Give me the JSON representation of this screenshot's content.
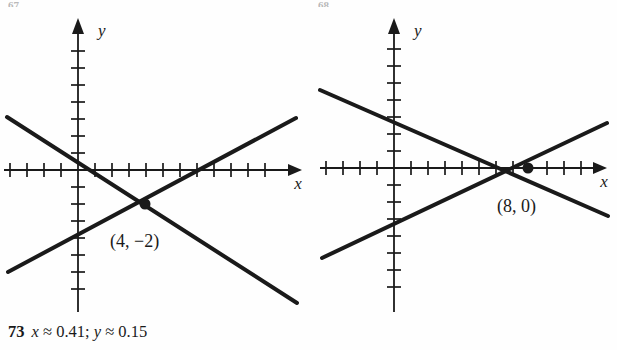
{
  "page": {
    "background_color": "#fefefe",
    "ink_color": "#1a1a1a",
    "clip_mark_left": "67.",
    "clip_mark_right": "68."
  },
  "answer": {
    "number": "73",
    "text": "x ≈ 0.41; y ≈ 0.15",
    "x_symbol": "x",
    "x_value": "≈ 0.41;",
    "y_symbol": "y",
    "y_value": "≈ 0.15"
  },
  "figures": [
    {
      "id": "figure-left",
      "name": "graph-left",
      "axis": {
        "x_label": "x",
        "y_label": "y",
        "origin_px": [
          78,
          170
        ],
        "tick_spacing_px": 17,
        "x_ticks_left": 4,
        "x_ticks_right": 13,
        "y_ticks_up": 7,
        "y_ticks_down": 8
      },
      "point": {
        "label": "(4, −2)",
        "x": 4,
        "y": -2,
        "px": [
          145,
          204
        ]
      },
      "lines": [
        {
          "name": "descending-line",
          "from_px": [
            7,
            117
          ],
          "to_px": [
            297,
            303
          ],
          "y_intercept": 1,
          "slope": -0.75
        },
        {
          "name": "ascending-line",
          "from_px": [
            8,
            272
          ],
          "to_px": [
            296,
            118
          ],
          "y_intercept": -6,
          "slope": 0.5
        }
      ]
    },
    {
      "id": "figure-right",
      "name": "graph-right",
      "axis": {
        "x_label": "x",
        "y_label": "y",
        "origin_px": [
          394,
          168
        ],
        "tick_spacing_px": 17,
        "x_ticks_left": 4,
        "x_ticks_right": 11,
        "y_ticks_up": 7,
        "y_ticks_down": 8
      },
      "point": {
        "label": "(8, 0)",
        "x": 8,
        "y": 0,
        "px": [
          528,
          168
        ]
      },
      "lines": [
        {
          "name": "descending-line",
          "from_px": [
            320,
            90
          ],
          "to_px": [
            608,
            216
          ],
          "y_intercept": 3,
          "slope": -0.375
        },
        {
          "name": "ascending-line",
          "from_px": [
            322,
            258
          ],
          "to_px": [
            607,
            123
          ],
          "y_intercept": -4,
          "slope": 0.5
        }
      ]
    }
  ]
}
